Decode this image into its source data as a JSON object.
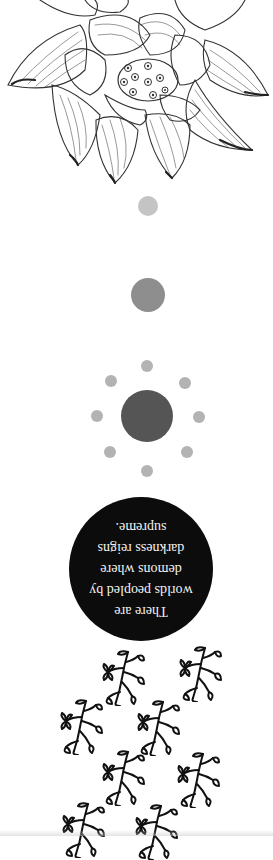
{
  "artwork": {
    "background_color": "#ffffff",
    "lotus": {
      "icon": "lotus-flower-sketch",
      "seedpod_holes": 9,
      "stroke_color": "#333333"
    },
    "moon_phases": [
      {
        "name": "small-moon",
        "cx": 148,
        "cy": 206,
        "r": 10,
        "color": "#c4c4c4"
      },
      {
        "name": "medium-moon",
        "cx": 148,
        "cy": 295,
        "r": 17,
        "color": "#8e8e8e"
      },
      {
        "name": "large-moon",
        "cx": 147,
        "cy": 416,
        "r": 26,
        "color": "#555555"
      }
    ],
    "orbit_dots": {
      "color": "#b3b3b3",
      "r": 6,
      "positions": [
        [
          147,
          366
        ],
        [
          111,
          381
        ],
        [
          185,
          383
        ],
        [
          97,
          416
        ],
        [
          199,
          417
        ],
        [
          110,
          452
        ],
        [
          187,
          452
        ],
        [
          147,
          471
        ]
      ]
    },
    "quote": {
      "disc_color": "#0c0c0c",
      "text_color": "#f2f2f2",
      "orientation": "upside-down",
      "lines": [
        "There are",
        "worlds peopled by",
        "demons where",
        "darkness reigns",
        "supreme."
      ]
    },
    "sprigs": {
      "icon": "leaf-sprig",
      "color": "#111111",
      "count": 8,
      "positions": [
        [
          100,
          650
        ],
        [
          177,
          645
        ],
        [
          58,
          697
        ],
        [
          135,
          698
        ],
        [
          100,
          748
        ],
        [
          175,
          750
        ],
        [
          60,
          800
        ],
        [
          133,
          802
        ]
      ]
    }
  }
}
